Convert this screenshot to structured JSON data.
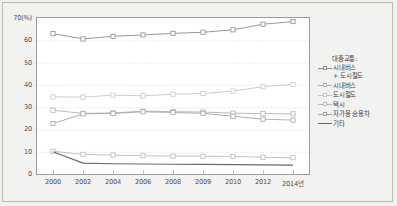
{
  "chart_data": {
    "type": "line",
    "title": "",
    "xlabel": "",
    "ylabel": "70(%)",
    "ylim": [
      0,
      70
    ],
    "grid": true,
    "legend_position": "right",
    "x": [
      "2000",
      "2002",
      "2004",
      "2006",
      "2008",
      "2009",
      "2010",
      "2012",
      "2014년"
    ],
    "categories": [
      "2000",
      "2002",
      "2004",
      "2006",
      "2008",
      "2009",
      "2010",
      "2012",
      "2014년"
    ],
    "y_ticks": [
      "70(%)",
      "60",
      "50",
      "40",
      "30",
      "20",
      "10",
      "0"
    ],
    "y_tick_values": [
      70,
      60,
      50,
      40,
      30,
      20,
      10,
      0
    ],
    "series": [
      {
        "name": "대중교통:\n시내버스\n+ 도시철도",
        "legend_label": "시내버스\n+ 도시철도",
        "color": "#8d8b88",
        "marker": "square",
        "values": [
          63.0,
          60.6,
          61.8,
          62.4,
          63.1,
          63.6,
          64.7,
          67.2,
          68.4
        ]
      },
      {
        "name": "시내버스",
        "legend_label": "시내버스",
        "color": "#b4b2af",
        "marker": "square",
        "values": [
          28.6,
          27.2,
          27.4,
          28.2,
          28.0,
          27.8,
          27.3,
          27.1,
          27.0
        ]
      },
      {
        "name": "도시철도",
        "legend_label": "도시철도",
        "color": "#c9c7c4",
        "marker": "square",
        "values": [
          34.6,
          34.5,
          35.4,
          35.1,
          35.8,
          36.1,
          37.2,
          39.2,
          40.2
        ]
      },
      {
        "name": "택시",
        "legend_label": "택시",
        "color": "#bcbab7",
        "marker": "square",
        "values": [
          10.2,
          8.8,
          8.5,
          8.2,
          8.0,
          8.0,
          7.9,
          7.5,
          7.3
        ]
      },
      {
        "name": "자가용 승용차",
        "legend_label": "자가용 승용차",
        "color": "#a9a7a4",
        "marker": "square",
        "values": [
          22.6,
          27.0,
          27.2,
          27.9,
          27.6,
          27.2,
          25.9,
          24.6,
          24.2
        ]
      },
      {
        "name": "기타",
        "legend_label": "기타",
        "color": "#6b6966",
        "marker": "none",
        "values": [
          10.0,
          4.9,
          4.6,
          4.5,
          4.4,
          4.3,
          4.2,
          4.1,
          4.0
        ]
      }
    ],
    "legend": {
      "title": "대중교통:",
      "entries": [
        "시내버스\n+ 도시철도",
        "시내버스",
        "도시철도",
        "택시",
        "자가용 승용차",
        "기타"
      ]
    }
  }
}
